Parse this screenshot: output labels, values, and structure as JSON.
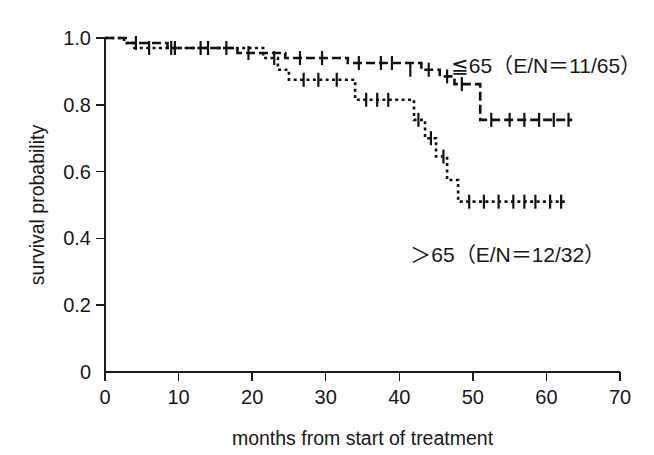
{
  "figure": {
    "background": "#ffffff",
    "ink_color": "#111111",
    "width": 654,
    "height": 455
  },
  "chart_data": {
    "type": "line",
    "title": "",
    "subtitle": "",
    "xlabel": "months from start of treatment",
    "ylabel": "survival probability",
    "xlim": [
      0,
      70
    ],
    "ylim": [
      0,
      1.0
    ],
    "xticks": [
      0,
      10,
      20,
      30,
      40,
      50,
      60,
      70
    ],
    "xticklabels": [
      "0",
      "10",
      "20",
      "30",
      "40",
      "50",
      "60",
      "70"
    ],
    "yticks": [
      0,
      0.2,
      0.4,
      0.6,
      0.8,
      1.0
    ],
    "yticklabels": [
      "0",
      "0.2",
      "0.4",
      "0.6",
      "0.8",
      "1.0"
    ],
    "grid": false,
    "legend_position": "inside-right",
    "plot_style": "kaplan-meier-step",
    "series": [
      {
        "name": "≦ 65",
        "label": "≦65（E/N＝11/65）",
        "label_text": "≦65 (E/N=11/65)",
        "dash": "dashed",
        "dash_pattern": "9,4",
        "events": 11,
        "n": 65,
        "label_x": 47,
        "label_y": 0.895,
        "x": [
          0,
          1.4,
          3.0,
          5.0,
          8.5,
          12.5,
          18.0,
          21.0,
          24.5,
          28.0,
          31.0,
          33.0,
          36.5,
          40.5,
          43.0,
          45.5,
          47.5,
          51.0,
          63.5
        ],
        "y": [
          1.0,
          1.0,
          0.985,
          0.985,
          0.97,
          0.97,
          0.955,
          0.955,
          0.94,
          0.94,
          0.94,
          0.925,
          0.925,
          0.925,
          0.905,
          0.885,
          0.862,
          0.755,
          0.755
        ],
        "censor_x": [
          4.2,
          9.0,
          14.0,
          19.5,
          23.0,
          26.5,
          29.5,
          34.5,
          37.5,
          39.0,
          41.5,
          44.0,
          46.5,
          48.5,
          52.5,
          55.0,
          57.0,
          59.0,
          61.0,
          63.0
        ],
        "censor_y": [
          0.985,
          0.97,
          0.97,
          0.955,
          0.94,
          0.94,
          0.94,
          0.925,
          0.925,
          0.925,
          0.905,
          0.905,
          0.885,
          0.862,
          0.755,
          0.755,
          0.755,
          0.755,
          0.755,
          0.755
        ]
      },
      {
        "name": "> 65",
        "label": "＞65（E/N＝12/32）",
        "label_text": ">65 (E/N=12/32)",
        "dash": "dotted",
        "dash_pattern": "3,3.4",
        "events": 12,
        "n": 32,
        "label_x": 41.5,
        "label_y": 0.33,
        "x": [
          0,
          1.2,
          2.6,
          4.0,
          19.5,
          21.5,
          23.5,
          25.0,
          30.0,
          32.5,
          34.0,
          40.5,
          42.0,
          43.5,
          45.0,
          46.5,
          48.0,
          62.5
        ],
        "y": [
          1.0,
          1.0,
          0.985,
          0.97,
          0.97,
          0.94,
          0.905,
          0.875,
          0.875,
          0.875,
          0.815,
          0.815,
          0.755,
          0.7,
          0.645,
          0.575,
          0.51,
          0.51
        ],
        "censor_x": [
          6.0,
          9.5,
          13.0,
          16.5,
          27.0,
          29.0,
          31.5,
          35.5,
          37.0,
          38.5,
          42.6,
          44.3,
          46.0,
          49.5,
          51.5,
          53.5,
          55.5,
          57.0,
          58.5,
          60.5,
          62.0
        ],
        "censor_y": [
          0.97,
          0.97,
          0.97,
          0.97,
          0.875,
          0.875,
          0.875,
          0.815,
          0.815,
          0.815,
          0.755,
          0.7,
          0.645,
          0.51,
          0.51,
          0.51,
          0.51,
          0.51,
          0.51,
          0.51,
          0.51
        ]
      }
    ]
  },
  "axes": {
    "x_axis_title": "months from start of treatment",
    "y_axis_title": "survival probability"
  }
}
